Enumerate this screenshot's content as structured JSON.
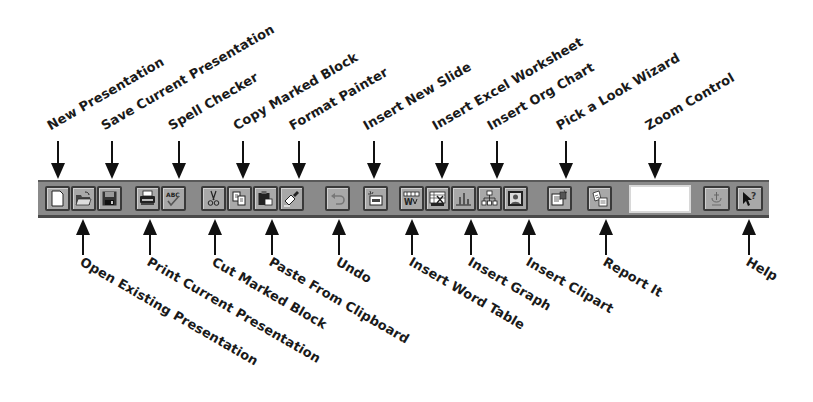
{
  "toolbar": {
    "zoom_control_value": "",
    "buttons": [
      {
        "id": "new",
        "icon": "new-page-icon"
      },
      {
        "id": "open",
        "icon": "folder-open-icon"
      },
      {
        "id": "save",
        "icon": "floppy-disk-icon"
      },
      {
        "id": "print",
        "icon": "printer-icon"
      },
      {
        "id": "spell",
        "icon": "spell-check-icon"
      },
      {
        "id": "cut",
        "icon": "scissors-icon"
      },
      {
        "id": "copy",
        "icon": "copy-icon"
      },
      {
        "id": "paste",
        "icon": "clipboard-icon"
      },
      {
        "id": "format-painter",
        "icon": "paintbrush-icon"
      },
      {
        "id": "undo",
        "icon": "undo-icon"
      },
      {
        "id": "new-slide",
        "icon": "new-slide-icon"
      },
      {
        "id": "word-table",
        "icon": "word-table-icon"
      },
      {
        "id": "excel",
        "icon": "excel-worksheet-icon"
      },
      {
        "id": "graph",
        "icon": "bar-graph-icon"
      },
      {
        "id": "org-chart",
        "icon": "org-chart-icon"
      },
      {
        "id": "clipart",
        "icon": "clipart-icon"
      },
      {
        "id": "pick-a-look",
        "icon": "wizard-icon"
      },
      {
        "id": "report-it",
        "icon": "report-icon"
      },
      {
        "id": "zoom-control",
        "icon": "zoom-box"
      },
      {
        "id": "graphics-disabled",
        "icon": "anchor-icon"
      },
      {
        "id": "help",
        "icon": "help-pointer-icon"
      }
    ]
  },
  "callouts": {
    "top": [
      {
        "label": "New Presentation"
      },
      {
        "label": "Save Current Presentation"
      },
      {
        "label": "Spell Checker"
      },
      {
        "label": "Copy Marked Block"
      },
      {
        "label": "Format Painter"
      },
      {
        "label": "Insert New Slide"
      },
      {
        "label": "Insert Excel Worksheet"
      },
      {
        "label": "Insert Org Chart"
      },
      {
        "label": "Pick a Look Wizard"
      },
      {
        "label": "Zoom Control"
      }
    ],
    "bottom": [
      {
        "label": "Open Existing Presentation"
      },
      {
        "label": "Print Current Presentation"
      },
      {
        "label": "Cut Marked Block"
      },
      {
        "label": "Paste From Clipboard"
      },
      {
        "label": "Undo"
      },
      {
        "label": "Insert Word Table"
      },
      {
        "label": "Insert Graph"
      },
      {
        "label": "Insert Clipart"
      },
      {
        "label": "Report It"
      },
      {
        "label": "Help"
      }
    ]
  }
}
